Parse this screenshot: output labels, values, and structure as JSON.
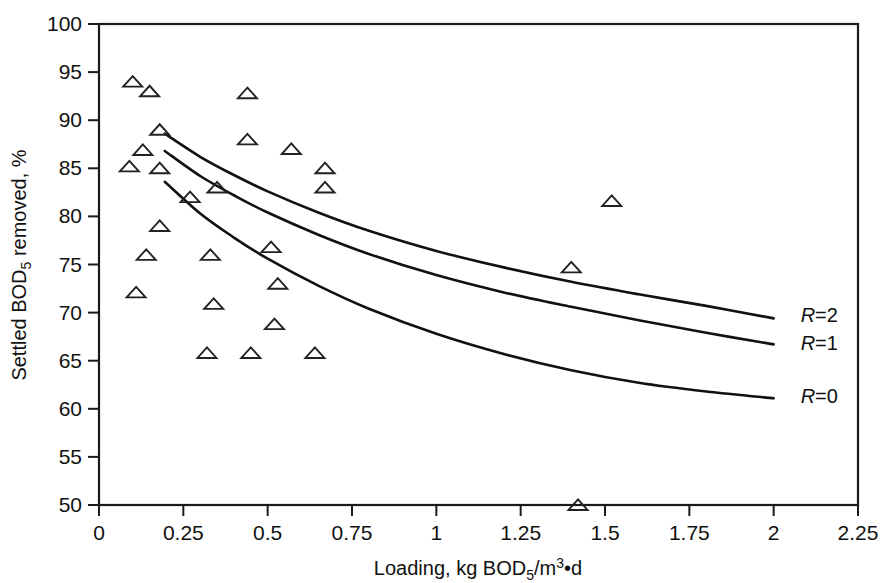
{
  "chart_data": {
    "type": "scatter",
    "title": "",
    "xlabel": "Loading, kg BOD₅/m³•d",
    "ylabel": "Settled BOD₅ removed, %",
    "xlim": [
      0,
      2.25
    ],
    "ylim": [
      50,
      100
    ],
    "grid": false,
    "legend_position": "inline-right-of-curves",
    "xticks": [
      "0",
      "0.25",
      "0.5",
      "0.75",
      "1",
      "1.25",
      "1.5",
      "1.75",
      "2",
      "2.25"
    ],
    "xtick_values": [
      0,
      0.25,
      0.5,
      0.75,
      1,
      1.25,
      1.5,
      1.75,
      2,
      2.25
    ],
    "yticks": [
      "50",
      "55",
      "60",
      "65",
      "70",
      "75",
      "80",
      "85",
      "90",
      "95",
      "100"
    ],
    "ytick_values": [
      50,
      55,
      60,
      65,
      70,
      75,
      80,
      85,
      90,
      95,
      100
    ],
    "marker": "open-triangle",
    "series": [
      {
        "name": "Observed data",
        "marker": "open-triangle",
        "points": [
          [
            0.1,
            94.0
          ],
          [
            0.15,
            93.0
          ],
          [
            0.09,
            85.2
          ],
          [
            0.13,
            86.9
          ],
          [
            0.11,
            72.1
          ],
          [
            0.14,
            76.0
          ],
          [
            0.18,
            89.0
          ],
          [
            0.18,
            85.0
          ],
          [
            0.18,
            79.0
          ],
          [
            0.27,
            82.0
          ],
          [
            0.32,
            65.8
          ],
          [
            0.33,
            76.0
          ],
          [
            0.34,
            70.9
          ],
          [
            0.35,
            83.0
          ],
          [
            0.44,
            92.8
          ],
          [
            0.44,
            88.0
          ],
          [
            0.45,
            65.8
          ],
          [
            0.51,
            76.8
          ],
          [
            0.53,
            73.0
          ],
          [
            0.52,
            68.8
          ],
          [
            0.57,
            87.0
          ],
          [
            0.64,
            65.8
          ],
          [
            0.67,
            85.0
          ],
          [
            0.67,
            83.0
          ],
          [
            1.42,
            50.0
          ],
          [
            1.4,
            74.7
          ],
          [
            1.52,
            81.6
          ]
        ]
      }
    ],
    "curves": [
      {
        "name": "R=2",
        "label": "R=2",
        "label_x": 2.08,
        "label_y": 69.8,
        "points": [
          [
            0.195,
            88.6
          ],
          [
            0.3,
            86.2
          ],
          [
            0.4,
            84.3
          ],
          [
            0.5,
            82.6
          ],
          [
            0.65,
            80.4
          ],
          [
            0.8,
            78.5
          ],
          [
            1.0,
            76.4
          ],
          [
            1.2,
            74.7
          ],
          [
            1.4,
            73.2
          ],
          [
            1.6,
            71.9
          ],
          [
            1.8,
            70.7
          ],
          [
            2.0,
            69.4
          ]
        ]
      },
      {
        "name": "R=1",
        "label": "R=1",
        "label_x": 2.08,
        "label_y": 66.8,
        "points": [
          [
            0.195,
            86.8
          ],
          [
            0.3,
            84.2
          ],
          [
            0.4,
            82.2
          ],
          [
            0.5,
            80.4
          ],
          [
            0.65,
            78.1
          ],
          [
            0.8,
            76.1
          ],
          [
            1.0,
            73.9
          ],
          [
            1.2,
            72.1
          ],
          [
            1.4,
            70.6
          ],
          [
            1.6,
            69.2
          ],
          [
            1.8,
            67.9
          ],
          [
            2.0,
            66.7
          ]
        ]
      },
      {
        "name": "R=0",
        "label": "R=0",
        "label_x": 2.08,
        "label_y": 61.3,
        "points": [
          [
            0.195,
            83.6
          ],
          [
            0.3,
            80.3
          ],
          [
            0.4,
            77.8
          ],
          [
            0.5,
            75.6
          ],
          [
            0.65,
            72.8
          ],
          [
            0.8,
            70.4
          ],
          [
            1.0,
            67.8
          ],
          [
            1.2,
            65.7
          ],
          [
            1.4,
            64.0
          ],
          [
            1.6,
            62.7
          ],
          [
            1.8,
            61.8
          ],
          [
            2.0,
            61.1
          ]
        ]
      }
    ]
  },
  "axes": {
    "x_title_parts": {
      "lead": "Loading, kg BOD",
      "sub1": "5",
      "slash_m": "/m",
      "sup": "3",
      "dot_d": "•d"
    },
    "y_title_parts": {
      "lead": "Settled BOD",
      "sub1": "5",
      "tail": " removed, %"
    }
  }
}
